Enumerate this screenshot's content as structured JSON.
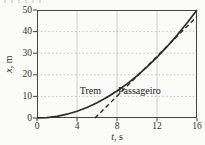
{
  "colors": {
    "background": "#fbfbf8",
    "curve": "#2b2b2b",
    "frame": "#454545",
    "grid_vertical": "#cccccc",
    "grid_horizontal": "#c3c3c3",
    "text": "#333333"
  },
  "chart_data": {
    "type": "line",
    "title": "",
    "xlabel": "t, s",
    "ylabel": "x, m",
    "xlabel_var": "t",
    "xlabel_unit": ", s",
    "ylabel_var": "x",
    "ylabel_unit": ", m",
    "xlim": [
      0,
      16
    ],
    "ylim": [
      0,
      50
    ],
    "xticks": [
      0,
      4,
      8,
      12,
      16
    ],
    "yticks": [
      0,
      10,
      20,
      30,
      40,
      50
    ],
    "grid": {
      "vertical_at": [
        4,
        8,
        12
      ],
      "horizontal_at": [
        10,
        20,
        30,
        40
      ]
    },
    "series": [
      {
        "name": "Trem",
        "style": "solid",
        "x": [
          0,
          1,
          2,
          3,
          4,
          5,
          6,
          7,
          8,
          9,
          10,
          11,
          12,
          13,
          14,
          15,
          16
        ],
        "y": [
          0,
          0.2,
          0.78,
          1.76,
          3.13,
          4.88,
          7.03,
          9.57,
          12.5,
          15.82,
          19.53,
          23.63,
          28.13,
          33.01,
          38.28,
          43.95,
          50
        ]
      },
      {
        "name": "Passageiro",
        "style": "dashed",
        "x": [
          5.8,
          16
        ],
        "y": [
          0,
          47
        ]
      }
    ],
    "annotations": [
      {
        "text": "Trem",
        "t": 6.4,
        "m": 12.7,
        "align": "right"
      },
      {
        "text": "Passageiro",
        "t": 8.1,
        "m": 12.7,
        "align": "left"
      }
    ],
    "legend": "none"
  }
}
